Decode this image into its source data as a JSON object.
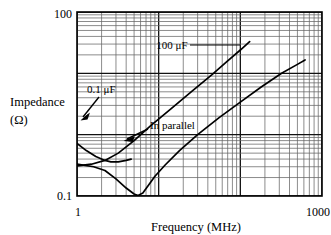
{
  "chart_data": {
    "type": "line",
    "title": "",
    "xlabel": "Frequency (MHz)",
    "ylabel_line1": "Impedance",
    "ylabel_line2": "(Ω)",
    "xscale": "log",
    "yscale": "log",
    "xlim": [
      1,
      1000
    ],
    "ylim": [
      0.1,
      100
    ],
    "xticks": [
      "1",
      "1000"
    ],
    "yticks": [
      "0.1",
      "100"
    ],
    "grid": "log-log minor gridlines both axes",
    "legend_position": "inline annotations",
    "annotations": [
      {
        "text": "100 μF",
        "points_to": "100uF-curve"
      },
      {
        "text": "0.1 μF",
        "points_to": "0.1uF-curve"
      },
      {
        "text": "In parallel",
        "points_to": "parallel-curve"
      }
    ],
    "series": [
      {
        "name": "0.1 μF",
        "points": [
          [
            1.0,
            0.72
          ],
          [
            1.3,
            0.55
          ],
          [
            1.7,
            0.44
          ],
          [
            2.2,
            0.38
          ],
          [
            2.6,
            0.36
          ],
          [
            3.2,
            0.36
          ],
          [
            4.0,
            0.38
          ],
          [
            4.6,
            0.4
          ]
        ]
      },
      {
        "name": "100 μF",
        "points": [
          [
            1.0,
            0.31
          ],
          [
            1.5,
            0.33
          ],
          [
            2.2,
            0.38
          ],
          [
            3.2,
            0.5
          ],
          [
            5.0,
            0.8
          ],
          [
            8.0,
            1.4
          ],
          [
            14.0,
            2.6
          ],
          [
            25.0,
            5.0
          ],
          [
            45.0,
            9.5
          ],
          [
            70.0,
            16.0
          ],
          [
            100.0,
            24.0
          ],
          [
            130.0,
            33.0
          ]
        ]
      },
      {
        "name": "In parallel",
        "points": [
          [
            1.0,
            0.33
          ],
          [
            1.6,
            0.3
          ],
          [
            2.2,
            0.26
          ],
          [
            3.0,
            0.19
          ],
          [
            4.0,
            0.135
          ],
          [
            5.0,
            0.108
          ],
          [
            5.6,
            0.102
          ],
          [
            6.4,
            0.112
          ],
          [
            7.5,
            0.15
          ],
          [
            9.0,
            0.21
          ],
          [
            12.0,
            0.32
          ],
          [
            18.0,
            0.55
          ],
          [
            30.0,
            1.0
          ],
          [
            55.0,
            1.9
          ],
          [
            100.0,
            3.4
          ],
          [
            180.0,
            6.0
          ],
          [
            320.0,
            10.0
          ],
          [
            500.0,
            14.0
          ],
          [
            620.0,
            16.5
          ]
        ]
      }
    ]
  },
  "axes": {
    "x_tick_left": "1",
    "x_tick_right": "1000",
    "y_tick_top": "100",
    "y_tick_bottom": "0.1",
    "x_axis_title": "Frequency (MHz)",
    "y_axis_title_line1": "Impedance",
    "y_axis_title_line2": "(Ω)"
  },
  "labels": {
    "label_100uf": "100 μF",
    "label_01uf": "0.1 μF",
    "label_parallel": "In parallel"
  },
  "colors": {
    "curve": "#000000",
    "grid": "#555555",
    "frame": "#000000",
    "background": "#ffffff"
  }
}
